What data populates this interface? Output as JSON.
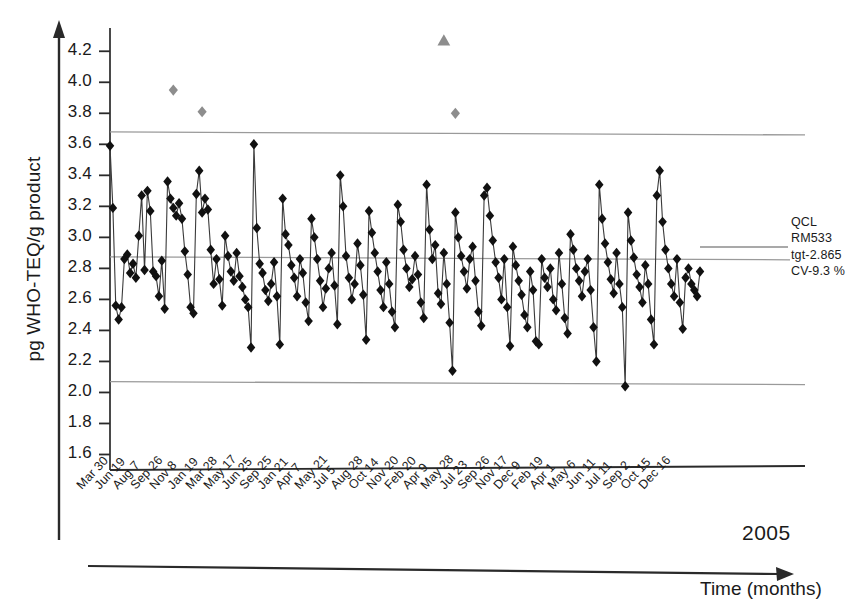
{
  "chart_data": {
    "type": "line",
    "title": "",
    "subtitle": "",
    "xlabel": "Time (months)",
    "ylabel": "pg WHO-TEQ/g product",
    "year_annotation": "2005",
    "ylim": [
      1.5,
      4.35
    ],
    "yticks": [
      1.6,
      1.8,
      2.0,
      2.2,
      2.4,
      2.6,
      2.8,
      3.0,
      3.2,
      3.4,
      3.6,
      3.8,
      4.0,
      4.2
    ],
    "ytick_labels": [
      "1.6",
      "1.8",
      "2.0",
      "2.2",
      "2.4",
      "2.6",
      "2.8",
      "3.0",
      "3.2",
      "3.4",
      "3.6",
      "3.8",
      "4.0",
      "4.2"
    ],
    "grid": false,
    "legend_position": "right",
    "legend_entries": [
      "QCL",
      "RM533",
      "tgt-2.865",
      "CV-9.3 %"
    ],
    "annotations": {
      "qc_label": "QCL",
      "reference_material": "RM533",
      "target": "tgt-2.865",
      "cv": "CV-9.3 %"
    },
    "reference_lines": [
      {
        "name": "upper-control-limit",
        "value": 3.67,
        "color": "#9a9a9a"
      },
      {
        "name": "target-center-line",
        "value": 2.865,
        "color": "#9a9a9a"
      },
      {
        "name": "lower-control-limit",
        "value": 2.06,
        "color": "#9a9a9a"
      }
    ],
    "xtick_labels": [
      "Mar 30",
      "Jun 19",
      "Aug 7",
      "Sep 26",
      "Nov 8",
      "Jan 19",
      "Mar 28",
      "May 17",
      "Jun 25",
      "Sep 25",
      "Jan 21",
      "Apr 7",
      "May 21",
      "Jul 5",
      "Aug 28",
      "Oct 14",
      "Nov 20",
      "Feb 20",
      "Apr 9",
      "May 28",
      "Jul 23",
      "Sep 26",
      "Nov 17",
      "Dec 9",
      "Feb 19",
      "Apr 1",
      "May 6",
      "Jun 11",
      "Jul 11",
      "Sep 2",
      "Oct 15",
      "Dec 16"
    ],
    "series": [
      {
        "name": "QC measurements",
        "marker": "diamond",
        "color": "#111111",
        "values": [
          3.59,
          3.19,
          2.56,
          2.47,
          2.55,
          2.86,
          2.89,
          2.77,
          2.83,
          2.74,
          3.01,
          3.27,
          2.79,
          3.3,
          3.17,
          2.78,
          2.75,
          2.62,
          2.85,
          2.54,
          3.36,
          3.25,
          3.19,
          3.14,
          3.22,
          3.12,
          2.91,
          2.76,
          2.55,
          2.51,
          3.28,
          3.43,
          3.16,
          3.25,
          3.18,
          2.92,
          2.7,
          2.86,
          2.73,
          2.56,
          3.01,
          2.88,
          2.78,
          2.72,
          2.9,
          2.75,
          2.68,
          2.6,
          2.55,
          2.29,
          3.6,
          3.06,
          2.83,
          2.77,
          2.66,
          2.59,
          2.7,
          2.84,
          2.62,
          2.31,
          3.25,
          3.02,
          2.95,
          2.82,
          2.74,
          2.62,
          2.86,
          2.77,
          2.58,
          2.46,
          3.12,
          3.0,
          2.86,
          2.72,
          2.55,
          2.67,
          2.8,
          2.9,
          2.69,
          2.44,
          3.4,
          3.2,
          2.88,
          2.74,
          2.6,
          2.7,
          2.96,
          2.82,
          2.63,
          2.34,
          3.17,
          3.03,
          2.9,
          2.78,
          2.66,
          2.55,
          2.84,
          2.7,
          2.52,
          2.42,
          3.21,
          3.1,
          2.92,
          2.8,
          2.68,
          2.73,
          2.88,
          2.76,
          2.58,
          2.48,
          3.34,
          3.05,
          2.86,
          2.95,
          2.64,
          2.57,
          2.9,
          2.7,
          2.45,
          2.14,
          3.16,
          3.0,
          2.88,
          2.78,
          2.67,
          2.86,
          2.94,
          2.72,
          2.52,
          2.43,
          3.27,
          3.32,
          3.14,
          2.98,
          2.84,
          2.74,
          2.6,
          2.86,
          2.55,
          2.3,
          2.94,
          2.82,
          2.72,
          2.63,
          2.5,
          2.42,
          2.78,
          2.66,
          2.33,
          2.31,
          2.86,
          2.74,
          2.68,
          2.8,
          2.6,
          2.53,
          2.9,
          2.7,
          2.48,
          2.38,
          3.02,
          2.92,
          2.8,
          2.72,
          2.62,
          2.78,
          2.86,
          2.66,
          2.42,
          2.2,
          3.34,
          3.12,
          2.96,
          2.84,
          2.73,
          2.64,
          2.9,
          2.7,
          2.55,
          2.04,
          3.16,
          2.98,
          2.87,
          2.76,
          2.68,
          2.58,
          2.82,
          2.7,
          2.47,
          2.31,
          3.27,
          3.43,
          3.1,
          2.92,
          2.8,
          2.7,
          2.62,
          2.86,
          2.58,
          2.41,
          2.74,
          2.8,
          2.7,
          2.66,
          2.62,
          2.78
        ]
      },
      {
        "name": "flagged outliers",
        "marker": "diamond",
        "color": "#8d8d8d",
        "points": [
          {
            "index": 22,
            "value": 3.95
          },
          {
            "index": 32,
            "value": 3.81
          },
          {
            "index": 120,
            "value": 3.8
          }
        ]
      },
      {
        "name": "flagged high outlier",
        "marker": "triangle",
        "color": "#8d8d8d",
        "points": [
          {
            "index": 116,
            "value": 4.27
          }
        ]
      }
    ]
  }
}
